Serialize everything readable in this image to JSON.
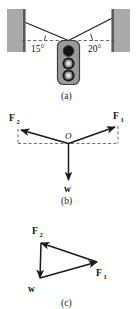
{
  "figure": {
    "panels": [
      {
        "id": "a",
        "caption": "(a)",
        "description": "Traffic light hung between two walls by two cables",
        "angles": [
          {
            "name": "left-cable-angle",
            "label": "15°",
            "value": 15
          },
          {
            "name": "right-cable-angle",
            "label": "20°",
            "value": 20
          }
        ],
        "traffic_light": {
          "lamps": [
            {
              "name": "top-lamp",
              "state": "filled"
            },
            {
              "name": "middle-lamp",
              "state": "ring"
            },
            {
              "name": "bottom-lamp",
              "state": "ring"
            }
          ]
        }
      },
      {
        "id": "b",
        "caption": "(b)",
        "description": "Free-body diagram at junction point O",
        "origin_label": "O",
        "vectors": [
          {
            "name": "force-2",
            "label": "F",
            "sub": "2",
            "direction": "up-left"
          },
          {
            "name": "force-1",
            "label": "F",
            "sub": "1",
            "direction": "up-right"
          },
          {
            "name": "weight",
            "label": "w",
            "sub": "",
            "direction": "down"
          }
        ]
      },
      {
        "id": "c",
        "caption": "(c)",
        "description": "Closed vector triangle of the three forces",
        "vectors": [
          {
            "name": "force-2",
            "label": "F",
            "sub": "2",
            "direction": "up-left"
          },
          {
            "name": "force-1",
            "label": "F",
            "sub": "1",
            "direction": "right"
          },
          {
            "name": "weight",
            "label": "w",
            "sub": "",
            "direction": "down"
          }
        ]
      }
    ]
  },
  "colors": {
    "wall_fill": "#a9a9a9",
    "wall_edge": "#5a5a5a",
    "housing_fill": "#9a9a9a",
    "housing_stroke": "#3d3d3d",
    "lamp_dark": "#1a1a1a",
    "line": "#1a1a1a",
    "dashed": "#555555",
    "background": "#ffffff"
  }
}
